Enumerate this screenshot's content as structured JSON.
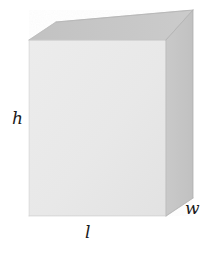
{
  "figure": {
    "name": "rectangular-box-dimensions",
    "background_color": "#ffffff",
    "shape": "rectangular prism",
    "labels": {
      "height": "h",
      "length": "l",
      "width": "w"
    },
    "faces": {
      "front": {
        "name": "front-face",
        "fill": "#e9e9e9",
        "stroke": "#d0d0d0",
        "points": "29,40 166,40 166,216 29,216"
      },
      "top": {
        "name": "top-face",
        "fill": "#c6c6c6",
        "stroke": "#b4b4b4",
        "points": "29,40 56,22 193,10 166,40"
      },
      "side": {
        "name": "right-side-face",
        "fill": "#c6c6c6",
        "stroke": "#b4b4b4",
        "points": "166,40 193,10 193,198 166,216"
      }
    },
    "colors": {
      "front_fill": "#e9e9e9",
      "top_fill": "#c6c6c6",
      "side_fill": "#c6c6c6",
      "label_color": "#1a1a1a"
    }
  }
}
